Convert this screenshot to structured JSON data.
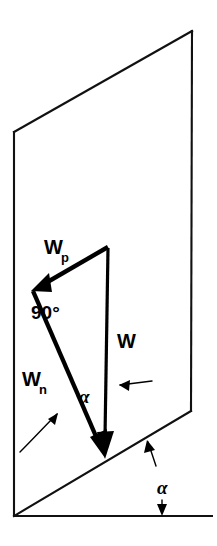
{
  "figure": {
    "background_color": "#ffffff",
    "ink_color": "#000000",
    "width": 217,
    "height": 546
  },
  "labels": {
    "weight_parallel_main": "W",
    "weight_parallel_sub": "p",
    "weight_normal_main": "W",
    "weight_normal_sub": "n",
    "weight_total": "W",
    "right_angle": "90°",
    "incline_angle_inner": "α",
    "incline_angle_ground": "α"
  },
  "geometry": {
    "plane": {
      "top_left": [
        14,
        132
      ],
      "top_right": [
        192,
        31
      ],
      "bottom_right": [
        191,
        411
      ],
      "bottom_left": [
        14,
        516
      ]
    },
    "ground_line": {
      "start": [
        14,
        516
      ],
      "end": [
        213,
        516
      ]
    },
    "vectors": [
      {
        "name": "weight-parallel",
        "label": "Wp",
        "from": [
          108,
          247
        ],
        "to": [
          32,
          291
        ]
      },
      {
        "name": "weight-normal",
        "label": "Wn",
        "from": [
          32,
          291
        ],
        "to": [
          104,
          457
        ]
      },
      {
        "name": "weight-total",
        "label": "W",
        "from": [
          108,
          249
        ],
        "to": [
          104,
          457
        ]
      }
    ]
  },
  "annotations": [
    {
      "name": "right-angle-marker",
      "text": "90°",
      "position": [
        31,
        312
      ]
    },
    {
      "name": "alpha-at-vector",
      "text": "α",
      "position": [
        83,
        398
      ],
      "leader": "horizontal arrow pointing left toward the W vector"
    },
    {
      "name": "alpha-at-ground",
      "text": "α",
      "position": [
        163,
        487
      ],
      "leader": "arrow up-left to incline edge and arrow down to ground line"
    },
    {
      "name": "wn-leader",
      "text": "",
      "position": [
        30,
        455
      ],
      "leader": "curved arrow pointing up-right to the Wn vector"
    }
  ]
}
